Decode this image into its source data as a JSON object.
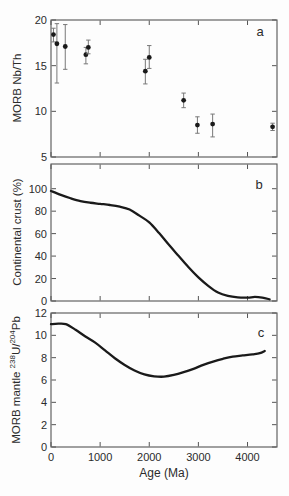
{
  "figure": {
    "width": 289,
    "height": 496,
    "background": "#fdfdfd",
    "frame_color": "#555555",
    "data_color": "#1a1a1a",
    "error_bar_color": "#787878",
    "text_color": "#2b2b2b"
  },
  "chart_data": [
    {
      "panel": "a",
      "type": "scatter",
      "ylabel": "MORB Nb/Th",
      "ylim": [
        5,
        20
      ],
      "yticks": [
        5,
        10,
        15,
        20
      ],
      "xlim": [
        0,
        4600
      ],
      "xticks": [
        0,
        1000,
        2000,
        3000,
        4000
      ],
      "points": [
        {
          "x": 50,
          "y": 18.4,
          "lo": 17.6,
          "hi": 19.1
        },
        {
          "x": 120,
          "y": 17.4,
          "lo": 13.1,
          "hi": 19.6
        },
        {
          "x": 290,
          "y": 17.1,
          "lo": 14.6,
          "hi": 19.5
        },
        {
          "x": 710,
          "y": 16.2,
          "lo": 15.2,
          "hi": 17.0
        },
        {
          "x": 760,
          "y": 17.0,
          "lo": 16.3,
          "hi": 17.8
        },
        {
          "x": 1920,
          "y": 14.4,
          "lo": 13.0,
          "hi": 15.7
        },
        {
          "x": 2000,
          "y": 15.9,
          "lo": 14.7,
          "hi": 17.2
        },
        {
          "x": 2700,
          "y": 11.2,
          "lo": 10.4,
          "hi": 12.0
        },
        {
          "x": 2980,
          "y": 8.5,
          "lo": 7.6,
          "hi": 9.4
        },
        {
          "x": 3290,
          "y": 8.6,
          "lo": 7.2,
          "hi": 9.7
        },
        {
          "x": 4510,
          "y": 8.3,
          "lo": 7.9,
          "hi": 8.7
        }
      ]
    },
    {
      "panel": "b",
      "type": "line",
      "ylabel": "Continental crust (%)",
      "ylim": [
        0,
        122
      ],
      "yticks": [
        0,
        20,
        40,
        60,
        80,
        100
      ],
      "xlim": [
        0,
        4600
      ],
      "xticks": [
        0,
        1000,
        2000,
        3000,
        4000
      ],
      "curve": [
        [
          0,
          98
        ],
        [
          200,
          94.5
        ],
        [
          400,
          91.5
        ],
        [
          600,
          89
        ],
        [
          800,
          87.5
        ],
        [
          1000,
          86.5
        ],
        [
          1200,
          85.5
        ],
        [
          1400,
          84
        ],
        [
          1600,
          81.5
        ],
        [
          1800,
          76
        ],
        [
          2000,
          70
        ],
        [
          2200,
          60.5
        ],
        [
          2400,
          50
        ],
        [
          2600,
          40
        ],
        [
          2800,
          30
        ],
        [
          3000,
          21
        ],
        [
          3200,
          13.5
        ],
        [
          3400,
          7.5
        ],
        [
          3600,
          4.5
        ],
        [
          3800,
          3.2
        ],
        [
          4000,
          3
        ],
        [
          4150,
          3.6
        ],
        [
          4300,
          3
        ],
        [
          4450,
          1.5
        ]
      ]
    },
    {
      "panel": "c",
      "type": "line",
      "ylabel_parts": {
        "prefix": "MORB mantle ",
        "sup1": "238",
        "mid": "U/",
        "sup2": "204",
        "end": "Pb"
      },
      "ylim": [
        0,
        12
      ],
      "yticks": [
        0,
        2,
        4,
        6,
        8,
        10,
        12
      ],
      "xlim": [
        0,
        4600
      ],
      "xticks": [
        0,
        1000,
        2000,
        3000,
        4000
      ],
      "xlabel": "Age (Ma)",
      "curve": [
        [
          0,
          11.0
        ],
        [
          150,
          11.05
        ],
        [
          300,
          11.0
        ],
        [
          500,
          10.5
        ],
        [
          700,
          9.9
        ],
        [
          900,
          9.35
        ],
        [
          1100,
          8.65
        ],
        [
          1300,
          7.95
        ],
        [
          1500,
          7.35
        ],
        [
          1700,
          6.85
        ],
        [
          1900,
          6.5
        ],
        [
          2100,
          6.33
        ],
        [
          2300,
          6.3
        ],
        [
          2500,
          6.45
        ],
        [
          2700,
          6.7
        ],
        [
          2900,
          7.0
        ],
        [
          3100,
          7.35
        ],
        [
          3300,
          7.65
        ],
        [
          3500,
          7.9
        ],
        [
          3700,
          8.1
        ],
        [
          3900,
          8.2
        ],
        [
          4100,
          8.3
        ],
        [
          4250,
          8.4
        ],
        [
          4350,
          8.6
        ]
      ]
    }
  ]
}
